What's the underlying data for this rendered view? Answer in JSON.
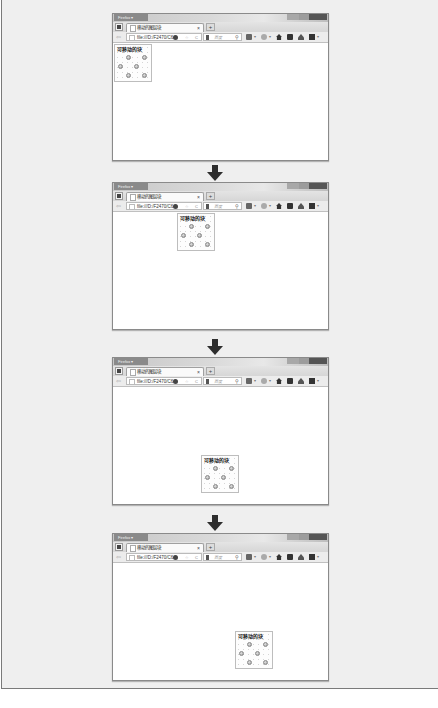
{
  "diagram": {
    "title": "",
    "frames": [
      {
        "step": 1,
        "block_position": {
          "left": 1,
          "top": 1
        }
      },
      {
        "step": 2,
        "block_position": {
          "left": 64,
          "top": 1
        }
      },
      {
        "step": 3,
        "block_position": {
          "left": 88,
          "top": 68
        }
      },
      {
        "step": 4,
        "block_position": {
          "left": 122,
          "top": 68
        }
      }
    ],
    "arrows": [
      {
        "from": 1,
        "to": 2,
        "icon": "arrow-down-icon"
      },
      {
        "from": 2,
        "to": 3,
        "icon": "arrow-down-icon"
      },
      {
        "from": 3,
        "to": 4,
        "icon": "arrow-down-icon"
      }
    ]
  },
  "browser": {
    "app_button_label": "Firefox ▾",
    "tab_title": "移动的图层块",
    "tab_close": "×",
    "new_tab": "+",
    "back": "⇦",
    "url": "file:///D:/F2470/C6/",
    "url_star": "☆",
    "url_reload": "C",
    "search_placeholder": "百度",
    "search_icon": "⚲",
    "dropdown": "▾"
  },
  "block": {
    "label": "可移动的块"
  },
  "colors": {
    "background": "#efefef",
    "arrow": "#2e2e2e",
    "window_border": "#8a8a8a"
  }
}
